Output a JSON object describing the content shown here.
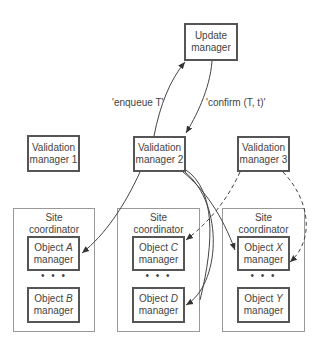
{
  "update_manager": {
    "line1": "Update",
    "line2": "manager"
  },
  "validation_managers": [
    {
      "line1": "Validation",
      "line2": "manager 1"
    },
    {
      "line1": "Validation",
      "line2": "manager 2"
    },
    {
      "line1": "Validation",
      "line2": "manager 3"
    }
  ],
  "edge_labels": {
    "enqueue": "'enqueue T'",
    "confirm": "'confirm (T, t)'"
  },
  "sites": [
    {
      "line1": "Site",
      "line2": "coordinator",
      "objects": [
        {
          "prefix": "Object ",
          "name": "A",
          "suffix": "manager"
        },
        {
          "prefix": "Object ",
          "name": "B",
          "suffix": "manager"
        }
      ],
      "dots": "• • •"
    },
    {
      "line1": "Site",
      "line2": "coordinator",
      "objects": [
        {
          "prefix": "Object ",
          "name": "C",
          "suffix": "manager"
        },
        {
          "prefix": "Object ",
          "name": "D",
          "suffix": "manager"
        }
      ],
      "dots": "• • •"
    },
    {
      "line1": "Site",
      "line2": "coordinator",
      "objects": [
        {
          "prefix": "Object ",
          "name": "X",
          "suffix": "manager"
        },
        {
          "prefix": "Object ",
          "name": "Y",
          "suffix": "manager"
        }
      ],
      "dots": "• • •"
    }
  ]
}
